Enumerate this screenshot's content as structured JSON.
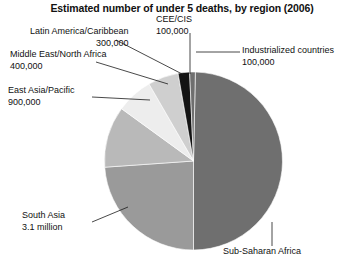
{
  "chart_data": {
    "type": "pie",
    "title": "Estimated number of under 5 deaths, by region (2006)",
    "xlabel": "",
    "ylabel": "",
    "legend_position": "callout-labels",
    "grid": false,
    "unit": "deaths",
    "categories": [
      "Sub-Saharan Africa",
      "South Asia",
      "East Asia/Pacific",
      "Middle East/North Africa",
      "Latin America/Caribbean",
      "CEE/CIS",
      "Industrialized countries"
    ],
    "values": [
      4800000,
      3100000,
      900000,
      400000,
      300000,
      100000,
      100000
    ],
    "value_labels": [
      "",
      "3.1 million",
      "900,000",
      "400,000",
      "300,000",
      "100,000",
      "100,000"
    ],
    "colors": [
      "#6f6f6f",
      "#9a9a9a",
      "#b9b9b9",
      "#ededed",
      "#cfcfcf",
      "#141414",
      "#6f6f6f"
    ],
    "slices": [
      {
        "name": "Sub-Saharan Africa",
        "value_label": "",
        "start_deg": 1.2,
        "end_deg": 180.0,
        "color": "#6f6f6f"
      },
      {
        "name": "South Asia",
        "value_label": "3.1 million",
        "start_deg": 180.0,
        "end_deg": 266.0,
        "color": "#9a9a9a"
      },
      {
        "name": "East Asia/Pacific",
        "value_label": "900,000",
        "start_deg": 266.0,
        "end_deg": 306.0,
        "color": "#b9b9b9"
      },
      {
        "name": "Middle East/North Africa",
        "value_label": "400,000",
        "start_deg": 306.0,
        "end_deg": 330.0,
        "color": "#ededed"
      },
      {
        "name": "Latin America/Caribbean",
        "value_label": "300,000",
        "start_deg": 330.0,
        "end_deg": 350.0,
        "color": "#cfcfcf"
      },
      {
        "name": "CEE/CIS",
        "value_label": "100,000",
        "start_deg": 350.0,
        "end_deg": 357.5,
        "color": "#141414"
      },
      {
        "name": "Industrialized countries",
        "value_label": "100,000",
        "start_deg": 357.5,
        "end_deg": 361.2,
        "color": "#6f6f6f"
      }
    ]
  },
  "labels": {
    "latin_america": {
      "name": "Latin America/Caribbean",
      "value": "300,000"
    },
    "middle_east": {
      "name": "Middle East/North Africa",
      "value": "400,000"
    },
    "east_asia": {
      "name": "East Asia/Pacific",
      "value": "900,000"
    },
    "south_asia": {
      "name": "South Asia",
      "value": "3.1 million"
    },
    "cee_cis": {
      "name": "CEE/CIS",
      "value": "100,000"
    },
    "industrialized": {
      "name": "Industrialized countries",
      "value": "100,000"
    },
    "subsaharan": {
      "name": "Sub-Saharan Africa",
      "value": ""
    }
  }
}
